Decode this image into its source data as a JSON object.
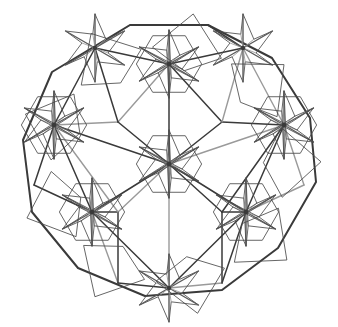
{
  "figure": {
    "title": "Geometric star-rosette tessellation",
    "type": "line-diagram",
    "background_color": "#ffffff",
    "canvas": {
      "width": 338,
      "height": 327
    },
    "stroke_colors": {
      "dark": "#3a3a3a",
      "medium": "#5a5a5a",
      "light": "#9a9a9a",
      "thin": "#4a4a4a"
    },
    "stroke_widths": {
      "heavy": 2.0,
      "medium": 1.5,
      "light": 1.4,
      "thin": 0.85
    },
    "lattice": {
      "description": "Triangular lattice of rosette centers",
      "spacing_x": 72,
      "spacing_y": 62,
      "origin": {
        "x": 169,
        "y": 164
      }
    },
    "rosette": {
      "points": 6,
      "outer_radius": 34,
      "inner_radius": 14,
      "pinwheel_twist_deg": 21,
      "hub_radius": 2.2
    },
    "rosette_centers": [
      {
        "id": "c-center",
        "x": 169,
        "y": 164,
        "full": true
      },
      {
        "id": "c-top",
        "x": 169,
        "y": 64,
        "full": true
      },
      {
        "id": "c-left",
        "x": 54,
        "y": 125,
        "full": true
      },
      {
        "id": "c-right",
        "x": 284,
        "y": 125,
        "full": true
      },
      {
        "id": "c-bottom-left",
        "x": 92,
        "y": 212,
        "full": true
      },
      {
        "id": "c-bottom-right",
        "x": 246,
        "y": 212,
        "full": true
      },
      {
        "id": "c-top-left",
        "x": 95,
        "y": 48,
        "full": false
      },
      {
        "id": "c-top-right",
        "x": 243,
        "y": 48,
        "full": false
      },
      {
        "id": "c-bottom",
        "x": 169,
        "y": 288,
        "full": false
      }
    ],
    "nodes": [
      {
        "id": "n0",
        "x": 169,
        "y": 164
      },
      {
        "id": "n1",
        "x": 169,
        "y": 64
      },
      {
        "id": "n2",
        "x": 54,
        "y": 125
      },
      {
        "id": "n3",
        "x": 284,
        "y": 125
      },
      {
        "id": "n4",
        "x": 92,
        "y": 212
      },
      {
        "id": "n5",
        "x": 246,
        "y": 212
      },
      {
        "id": "n6",
        "x": 95,
        "y": 48
      },
      {
        "id": "n7",
        "x": 243,
        "y": 48
      },
      {
        "id": "n8",
        "x": 169,
        "y": 288
      },
      {
        "id": "n9",
        "x": 118,
        "y": 122
      },
      {
        "id": "n10",
        "x": 222,
        "y": 122
      },
      {
        "id": "n11",
        "x": 118,
        "y": 212
      },
      {
        "id": "n12",
        "x": 222,
        "y": 212
      },
      {
        "id": "n13",
        "x": 130,
        "y": 25
      },
      {
        "id": "n14",
        "x": 208,
        "y": 25
      },
      {
        "id": "n15",
        "x": 34,
        "y": 185
      },
      {
        "id": "n16",
        "x": 304,
        "y": 185
      },
      {
        "id": "n17",
        "x": 118,
        "y": 283
      },
      {
        "id": "n18",
        "x": 222,
        "y": 283
      }
    ],
    "hull_vertices": [
      {
        "x": 130,
        "y": 25
      },
      {
        "x": 208,
        "y": 25
      },
      {
        "x": 272,
        "y": 58
      },
      {
        "x": 310,
        "y": 118
      },
      {
        "x": 316,
        "y": 182
      },
      {
        "x": 278,
        "y": 248
      },
      {
        "x": 222,
        "y": 290
      },
      {
        "x": 145,
        "y": 296
      },
      {
        "x": 78,
        "y": 268
      },
      {
        "x": 32,
        "y": 212
      },
      {
        "x": 23,
        "y": 140
      },
      {
        "x": 52,
        "y": 72
      }
    ],
    "bounds": {
      "left": 20,
      "top": 19,
      "right": 321,
      "bottom": 314
    },
    "star_tip_count": 9,
    "line_segment_count": 212
  }
}
